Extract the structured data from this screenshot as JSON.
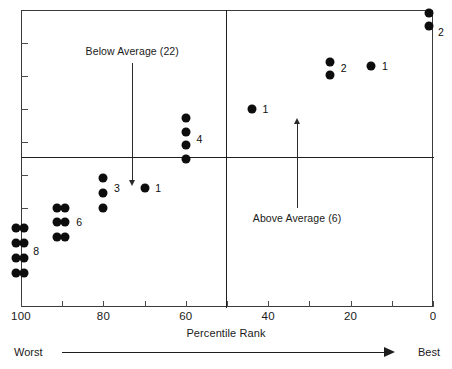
{
  "chart_data": {
    "type": "scatter",
    "title": "",
    "xlabel": "Percentile Rank",
    "ylabel": "",
    "xlim": [
      100,
      0
    ],
    "x_axis_reversed": true,
    "xticks": [
      100,
      80,
      60,
      40,
      20,
      0
    ],
    "xtick_labels": [
      "100",
      "80",
      "60",
      "40",
      "20",
      "0"
    ],
    "minor_xticks": [
      100,
      90,
      80,
      70,
      60,
      50,
      40,
      30,
      20,
      10,
      0
    ],
    "yticks_unlabeled": 8,
    "grid": false,
    "legend": "none",
    "quadrant_divider_x": 50,
    "quadrant_divider_y": 0.5,
    "dot_color": "#0d0d0d",
    "frame_color": "#3a3a3a",
    "divider_color": "#1e1e1e",
    "clusters": [
      {
        "label": "8",
        "count": 8,
        "x": 100,
        "group": "below-average",
        "dots": [
          [
            99.3,
            0.115
          ],
          [
            101.3,
            0.115
          ],
          [
            99.3,
            0.165
          ],
          [
            101.3,
            0.165
          ],
          [
            99.3,
            0.215
          ],
          [
            101.3,
            0.215
          ],
          [
            99.3,
            0.265
          ],
          [
            101.3,
            0.265
          ]
        ],
        "label_pos": [
          97.0,
          0.19
        ]
      },
      {
        "label": "6",
        "count": 6,
        "x": 90,
        "group": "below-average",
        "dots": [
          [
            89.2,
            0.235
          ],
          [
            91.2,
            0.235
          ],
          [
            89.2,
            0.285
          ],
          [
            91.2,
            0.285
          ],
          [
            89.2,
            0.335
          ],
          [
            91.2,
            0.335
          ]
        ],
        "label_pos": [
          86.6,
          0.285
        ]
      },
      {
        "label": "3",
        "count": 3,
        "x": 80,
        "group": "below-average",
        "dots": [
          [
            80,
            0.335
          ],
          [
            80,
            0.385
          ],
          [
            80,
            0.435
          ]
        ],
        "label_pos": [
          77.4,
          0.4
        ]
      },
      {
        "label": "1",
        "count": 1,
        "x": 70,
        "group": "below-average",
        "dots": [
          [
            70,
            0.4
          ]
        ],
        "label_pos": [
          67.4,
          0.4
        ]
      },
      {
        "label": "4",
        "count": 4,
        "x": 60,
        "group": "below-average",
        "dots": [
          [
            60,
            0.5
          ],
          [
            60,
            0.545
          ],
          [
            60,
            0.59
          ],
          [
            60,
            0.635
          ]
        ],
        "label_pos": [
          57.4,
          0.565
        ]
      },
      {
        "label": "1",
        "count": 1,
        "x": 44,
        "group": "above-average",
        "dots": [
          [
            44,
            0.665
          ]
        ],
        "label_pos": [
          41.4,
          0.665
        ]
      },
      {
        "label": "2",
        "count": 2,
        "x": 25,
        "group": "above-average",
        "dots": [
          [
            25,
            0.78
          ],
          [
            25,
            0.825
          ]
        ],
        "label_pos": [
          22.4,
          0.805
        ]
      },
      {
        "label": "1",
        "count": 1,
        "x": 15,
        "group": "above-average",
        "dots": [
          [
            15,
            0.81
          ]
        ],
        "label_pos": [
          12.4,
          0.81
        ]
      },
      {
        "label": "2",
        "count": 2,
        "x": 1,
        "group": "above-average",
        "dots": [
          [
            1,
            0.945
          ],
          [
            1,
            0.99
          ]
        ],
        "label_pos": [
          -1.2,
          0.925
        ]
      }
    ],
    "annotations": [
      {
        "text": "Below Average (22)",
        "count": 22,
        "direction": "down",
        "text_x": 73,
        "text_y": 0.86,
        "arrow_from_y": 0.82,
        "arrow_to_y": 0.425
      },
      {
        "text": "Above Average (6)",
        "count": 6,
        "direction": "up",
        "text_x": 33,
        "text_y": 0.295,
        "arrow_from_y": 0.335,
        "arrow_to_y": 0.62
      }
    ],
    "scale_bar": {
      "left_label": "Worst",
      "right_label": "Best",
      "direction": "right"
    }
  }
}
